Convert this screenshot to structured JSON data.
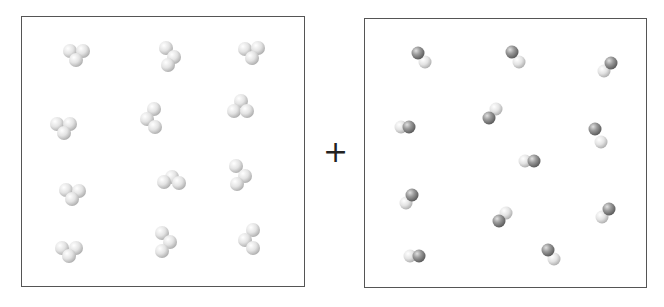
{
  "diagram": {
    "title": "",
    "operator": "+",
    "left_box": {
      "name": "reactant-box-triatomic",
      "molecule_type": "triatomic-light",
      "count": 12,
      "molecules": [
        {
          "atoms": [
            [
              70,
              51
            ],
            [
              83,
              51
            ],
            [
              76,
              60
            ]
          ]
        },
        {
          "atoms": [
            [
              166,
              48
            ],
            [
              174,
              57
            ],
            [
              168,
              65
            ]
          ]
        },
        {
          "atoms": [
            [
              245,
              49
            ],
            [
              258,
              48
            ],
            [
              252,
              58
            ]
          ]
        },
        {
          "atoms": [
            [
              57,
              124
            ],
            [
              70,
              124
            ],
            [
              64,
              133
            ]
          ]
        },
        {
          "atoms": [
            [
              154,
              109
            ],
            [
              147,
              119
            ],
            [
              155,
              127
            ]
          ]
        },
        {
          "atoms": [
            [
              241,
              101
            ],
            [
              234,
              111
            ],
            [
              247,
              111
            ]
          ]
        },
        {
          "atoms": [
            [
              66,
              190
            ],
            [
              79,
              191
            ],
            [
              72,
              199
            ]
          ]
        },
        {
          "atoms": [
            [
              172,
              177
            ],
            [
              164,
              182
            ],
            [
              179,
              183
            ]
          ]
        },
        {
          "atoms": [
            [
              236,
              166
            ],
            [
              245,
              176
            ],
            [
              237,
              184
            ]
          ]
        },
        {
          "atoms": [
            [
              62,
              248
            ],
            [
              76,
              248
            ],
            [
              69,
              256
            ]
          ]
        },
        {
          "atoms": [
            [
              162,
              233
            ],
            [
              170,
              242
            ],
            [
              162,
              251
            ]
          ]
        },
        {
          "atoms": [
            [
              253,
              230
            ],
            [
              245,
              240
            ],
            [
              253,
              248
            ]
          ]
        }
      ]
    },
    "right_box": {
      "name": "reactant-box-diatomic",
      "molecule_type": "diatomic-dark-light",
      "count": 12,
      "molecules": [
        {
          "dark": [
            418,
            53
          ],
          "light": [
            425,
            62
          ]
        },
        {
          "dark": [
            512,
            52
          ],
          "light": [
            519,
            62
          ]
        },
        {
          "dark": [
            611,
            63
          ],
          "light": [
            604,
            71
          ]
        },
        {
          "dark": [
            409,
            127
          ],
          "light": [
            401,
            127
          ]
        },
        {
          "dark": [
            489,
            118
          ],
          "light": [
            496,
            109
          ]
        },
        {
          "dark": [
            595,
            129
          ],
          "light": [
            601,
            142
          ]
        },
        {
          "dark": [
            534,
            161
          ],
          "light": [
            525,
            161
          ]
        },
        {
          "dark": [
            412,
            195
          ],
          "light": [
            406,
            203
          ]
        },
        {
          "dark": [
            499,
            221
          ],
          "light": [
            506,
            213
          ]
        },
        {
          "dark": [
            609,
            209
          ],
          "light": [
            602,
            217
          ]
        },
        {
          "dark": [
            419,
            256
          ],
          "light": [
            410,
            256
          ]
        },
        {
          "dark": [
            548,
            250
          ],
          "light": [
            554,
            259
          ]
        }
      ]
    },
    "colors": {
      "light_atom": "#e6e6e6",
      "light_atom_shade": "#b8b8b8",
      "dark_atom": "#9a9a9a",
      "dark_atom_shade": "#5e5e5e",
      "border": "#555555",
      "operator": "#222222"
    }
  }
}
